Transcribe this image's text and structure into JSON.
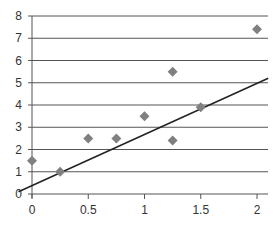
{
  "chart_data": {
    "type": "scatter",
    "title": "",
    "xlabel": "",
    "ylabel": "",
    "xlim": [
      0,
      2.05
    ],
    "ylim": [
      0,
      8
    ],
    "grid": {
      "horizontal": true,
      "vertical": false
    },
    "x_ticks": [
      "0",
      "0.5",
      "1",
      "1.5",
      "2"
    ],
    "y_ticks": [
      "0",
      "1",
      "2",
      "3",
      "4",
      "5",
      "6",
      "7",
      "8"
    ],
    "legend": null,
    "series": [
      {
        "name": "data",
        "marker": "diamond",
        "color": "#808080",
        "points": [
          {
            "x": 0,
            "y": 1.5
          },
          {
            "x": 0.25,
            "y": 1.0
          },
          {
            "x": 0.5,
            "y": 2.5
          },
          {
            "x": 0.75,
            "y": 2.5
          },
          {
            "x": 1.0,
            "y": 3.5
          },
          {
            "x": 1.25,
            "y": 5.5
          },
          {
            "x": 1.25,
            "y": 2.4
          },
          {
            "x": 1.5,
            "y": 3.9
          },
          {
            "x": 2.0,
            "y": 7.4
          }
        ]
      },
      {
        "name": "trend line",
        "type": "line",
        "color": "#222222",
        "points": [
          {
            "x": -0.12,
            "y": 0.1
          },
          {
            "x": 2.1,
            "y": 5.2
          }
        ]
      }
    ]
  }
}
